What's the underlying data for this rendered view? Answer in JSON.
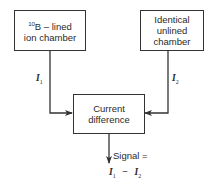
{
  "diagram": {
    "left_box": {
      "isotope_mass": "10",
      "line1_rest": "B – lined",
      "line2": "ion chamber"
    },
    "right_box": {
      "lines": [
        "Identical",
        "unlined",
        "chamber"
      ]
    },
    "center_box": {
      "lines": [
        "Current",
        "difference"
      ]
    },
    "currents": {
      "left": {
        "symbol": "I",
        "sub": "1"
      },
      "right": {
        "symbol": "I",
        "sub": "2"
      }
    },
    "output": {
      "label": "Signal =",
      "expr_left": {
        "symbol": "I",
        "sub": "1"
      },
      "operator": "−",
      "expr_right": {
        "symbol": "I",
        "sub": "2"
      }
    },
    "colors": {
      "line": "#333333",
      "text": "#2a2a2a",
      "background": "#ffffff"
    }
  }
}
